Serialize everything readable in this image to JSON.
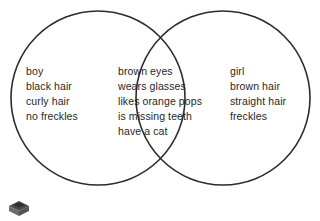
{
  "diagram": {
    "type": "venn",
    "title": "",
    "background_color": "#ffffff",
    "stroke_color": "#2b2b2b",
    "text_color": "#1f1f1f",
    "sets": [
      {
        "id": "left",
        "label": "boy",
        "region": "left-only",
        "items": [
          "boy",
          "black hair",
          "curly hair",
          "no freckles"
        ]
      },
      {
        "id": "right",
        "label": "girl",
        "region": "right-only",
        "items": [
          "girl",
          "brown hair",
          "straight hair",
          "freckles"
        ]
      }
    ],
    "intersection": {
      "id": "both",
      "region": "overlap",
      "items": [
        "brown eyes",
        "wears glasses",
        "likes orange pops",
        "is missing teeth",
        "have a cat"
      ]
    }
  },
  "icons": {
    "broken_image_placeholder": "box-icon"
  }
}
